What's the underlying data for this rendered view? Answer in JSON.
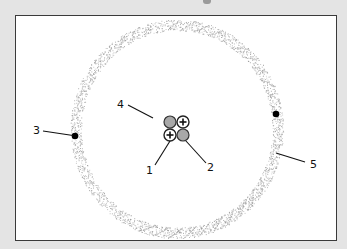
{
  "diagram": {
    "type": "atom-model",
    "atom": "helium",
    "colors": {
      "background": "#e4e4e4",
      "frame_fill": "#ffffff",
      "frame_border": "#3a3a3a",
      "ring_stipple": "#9a9a9a",
      "neutron_fill": "#a8a8a8",
      "proton_fill": "#ffffff",
      "electron_fill": "#000000"
    },
    "nucleus": {
      "particles": [
        {
          "kind": "neutron",
          "position": "top-left",
          "symbol": ""
        },
        {
          "kind": "proton",
          "position": "top-right",
          "symbol": "+"
        },
        {
          "kind": "proton",
          "position": "bottom-left",
          "symbol": "+"
        },
        {
          "kind": "neutron",
          "position": "bottom-right",
          "symbol": ""
        }
      ]
    },
    "electrons": [
      {
        "position": "left"
      },
      {
        "position": "right"
      }
    ],
    "labels": [
      {
        "id": "1",
        "text": "1",
        "target": "proton"
      },
      {
        "id": "2",
        "text": "2",
        "target": "neutron"
      },
      {
        "id": "3",
        "text": "3",
        "target": "electron"
      },
      {
        "id": "4",
        "text": "4",
        "target": "nucleus"
      },
      {
        "id": "5",
        "text": "5",
        "target": "electron cloud / shell"
      }
    ]
  }
}
